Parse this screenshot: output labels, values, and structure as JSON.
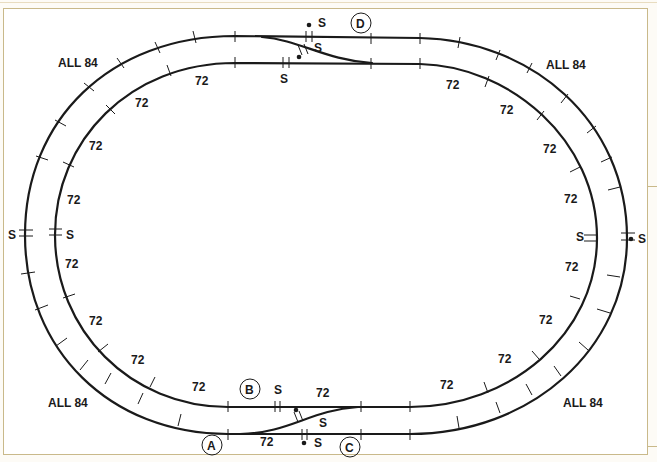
{
  "diagram": {
    "title": "",
    "type": "track-layout",
    "colors": {
      "track": "#1a1a1a",
      "frame": "#c9b98a",
      "background": "#ffffff"
    },
    "loops": [
      {
        "name": "outer-loop",
        "curve_label": "ALL 84"
      },
      {
        "name": "inner-loop",
        "curve_label": "72"
      }
    ],
    "labels": {
      "all84_tl": "ALL 84",
      "all84_tr": "ALL 84",
      "all84_bl": "ALL 84",
      "all84_br": "ALL 84",
      "r72": [
        "72",
        "72",
        "72",
        "72",
        "72",
        "72",
        "72",
        "72",
        "72",
        "72",
        "72",
        "72",
        "72",
        "72",
        "72",
        "72",
        "72",
        "72"
      ],
      "s": "S"
    },
    "points": {
      "A": "A",
      "B": "B",
      "C": "C",
      "D": "D"
    }
  }
}
